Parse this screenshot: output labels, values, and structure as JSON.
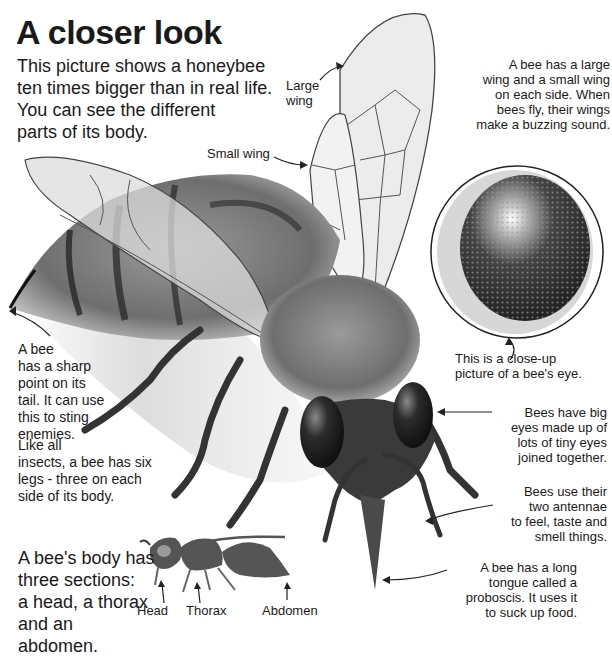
{
  "header": {
    "title": "A closer look",
    "intro": "This picture shows a honeybee\nten times bigger than in real life.\nYou can see the different\nparts of its body."
  },
  "labels": {
    "large_wing": "Large\nwing",
    "small_wing": "Small wing"
  },
  "notes": {
    "wings": "A bee has a large\nwing and a small wing\non each side. When\nbees fly, their wings\nmake a buzzing sound.",
    "eye_closeup": "This is a close-up\npicture of a bee's eye.",
    "sting": "A bee\nhas a sharp\npoint on its\ntail. It can use\nthis to sting\nenemies.",
    "legs": "Like all\ninsects, a bee has six\nlegs - three on each\nside of its body.",
    "eyes": "Bees have big\neyes made up of\nlots of tiny eyes\njoined together.",
    "antennae": "Bees use their\ntwo antennae\nto feel, taste and\nsmell things.",
    "tongue": "A bee has a long\ntongue called a\nproboscis. It uses it\nto suck up food."
  },
  "body_sections": {
    "text": "A bee's body has\nthree sections:\na head, a thorax\nand an\nabdomen.",
    "parts": [
      "Head",
      "Thorax",
      "Abdomen"
    ]
  },
  "colors": {
    "text": "#1a1a1a",
    "background": "#ffffff",
    "silhouette": "#555555",
    "eye": "#2a2a2a",
    "wing": "#e8e8e8",
    "fur": "#7a7a7a"
  }
}
